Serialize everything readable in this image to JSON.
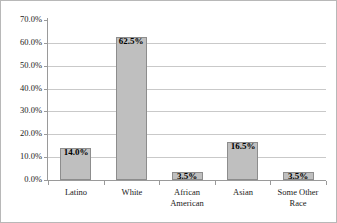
{
  "chart_data": {
    "type": "bar",
    "title": "",
    "subtitle": "",
    "xlabel": "",
    "ylabel": "",
    "categories": [
      "Latino",
      "White",
      "African American",
      "Asian",
      "Some Other Race"
    ],
    "values": [
      14.0,
      62.5,
      3.5,
      16.5,
      3.5
    ],
    "data_labels": [
      "14.0%",
      "62.5%",
      "3.5%",
      "16.5%",
      "3.5%"
    ],
    "ylim": [
      0,
      70
    ],
    "ytick_values": [
      0,
      10,
      20,
      30,
      40,
      50,
      60,
      70
    ],
    "ytick_labels": [
      "0.0%",
      "10.0%",
      "20.0%",
      "30.0%",
      "40.0%",
      "50.0%",
      "60.0%",
      "70.0%"
    ],
    "category_label_lines": [
      [
        "Latino"
      ],
      [
        "White"
      ],
      [
        "African",
        "American"
      ],
      [
        "Asian"
      ],
      [
        "Some Other",
        "Race"
      ]
    ],
    "grid": {
      "horizontal": true,
      "vertical": false
    },
    "legend": {
      "visible": false,
      "position": "none",
      "entries": []
    },
    "colors": {
      "bar_fill": "#BFBFBF",
      "bar_border": "#8D8D8D",
      "gridline": "#C9C9C9",
      "axis": "#9A9A9A",
      "text": "#1A1A1A",
      "data_label": "#000000",
      "background": "#FFFFFF",
      "frame_border": "#B8B8B8"
    }
  }
}
